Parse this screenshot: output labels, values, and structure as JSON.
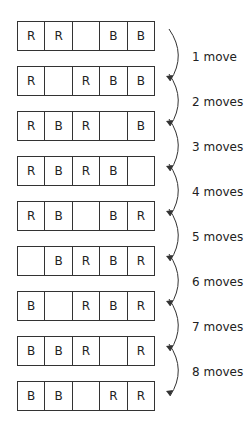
{
  "title": "",
  "rows": [
    {
      "cells": [
        "R",
        "R",
        "",
        "B",
        "B"
      ]
    },
    {
      "cells": [
        "R",
        "",
        "R",
        "B",
        "B"
      ]
    },
    {
      "cells": [
        "R",
        "B",
        "R",
        "",
        "B"
      ]
    },
    {
      "cells": [
        "R",
        "B",
        "R",
        "B",
        ""
      ]
    },
    {
      "cells": [
        "R",
        "B",
        "",
        "B",
        "R"
      ]
    },
    {
      "cells": [
        "",
        "B",
        "R",
        "B",
        "R"
      ]
    },
    {
      "cells": [
        "B",
        "",
        "R",
        "B",
        "R"
      ]
    },
    {
      "cells": [
        "B",
        "B",
        "R",
        "",
        "R"
      ]
    },
    {
      "cells": [
        "B",
        "B",
        "",
        "R",
        "R"
      ]
    }
  ],
  "moves": [
    "1 move",
    "2 moves",
    "3 moves",
    "4 moves",
    "5 moves",
    "6 moves",
    "7 moves",
    "8 moves"
  ],
  "colors": {
    "line": "#333333",
    "text": "#222222",
    "background": "#ffffff"
  }
}
